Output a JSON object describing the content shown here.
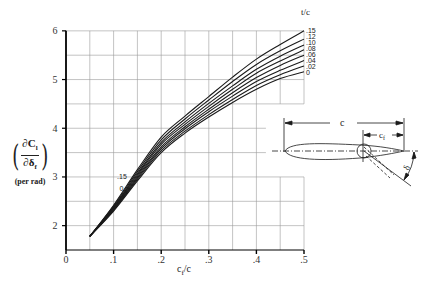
{
  "chart_data": {
    "type": "line",
    "title": "",
    "xlabel": "c_f/c",
    "ylabel": "(∂C_l / ∂δ_f) (per rad)",
    "xlim": [
      0,
      0.5
    ],
    "ylim": [
      1.5,
      6
    ],
    "xticks": [
      0,
      0.1,
      0.2,
      0.3,
      0.4,
      0.5
    ],
    "xtick_labels": [
      "0",
      ".1",
      ".2",
      ".3",
      ".4",
      ".5"
    ],
    "yticks": [
      2,
      3,
      4,
      5,
      6
    ],
    "ytick_labels": [
      "2",
      "3",
      "4",
      "5",
      "6"
    ],
    "grid": true,
    "legend_title": "t/c",
    "legend_position": "right end of curves",
    "x": [
      0.05,
      0.1,
      0.15,
      0.2,
      0.25,
      0.3,
      0.35,
      0.4,
      0.45,
      0.5
    ],
    "series": [
      {
        "name": ".15",
        "values": [
          1.78,
          2.42,
          3.15,
          3.82,
          4.25,
          4.65,
          5.05,
          5.42,
          5.72,
          6.0
        ]
      },
      {
        "name": ".12",
        "values": [
          1.78,
          2.4,
          3.11,
          3.76,
          4.19,
          4.58,
          4.96,
          5.31,
          5.59,
          5.83
        ]
      },
      {
        "name": ".10",
        "values": [
          1.78,
          2.38,
          3.07,
          3.71,
          4.13,
          4.51,
          4.87,
          5.21,
          5.48,
          5.71
        ]
      },
      {
        "name": ".08",
        "values": [
          1.78,
          2.37,
          3.04,
          3.67,
          4.08,
          4.45,
          4.8,
          5.13,
          5.38,
          5.61
        ]
      },
      {
        "name": ".06",
        "values": [
          1.78,
          2.35,
          3.01,
          3.62,
          4.03,
          4.39,
          4.73,
          5.04,
          5.29,
          5.5
        ]
      },
      {
        "name": ".04",
        "values": [
          1.78,
          2.33,
          2.98,
          3.58,
          3.99,
          4.34,
          4.66,
          4.96,
          5.19,
          5.39
        ]
      },
      {
        "name": ".02",
        "values": [
          1.78,
          2.32,
          2.95,
          3.54,
          3.94,
          4.28,
          4.59,
          4.88,
          5.1,
          5.28
        ]
      },
      {
        "name": "0",
        "values": [
          1.78,
          2.3,
          2.92,
          3.5,
          3.9,
          4.23,
          4.53,
          4.8,
          5.02,
          5.16
        ]
      }
    ],
    "annotations": [
      {
        "text": ".15",
        "x": 0.12,
        "y": 2.95
      },
      {
        "text": "0",
        "x": 0.125,
        "y": 2.72
      }
    ]
  },
  "labels": {
    "y_numerator": "∂C",
    "y_numerator_sub": "l",
    "y_denominator": "∂δ",
    "y_denominator_sub": "f",
    "y_units": "(per rad)",
    "x_main": "c",
    "x_sub": "f",
    "x_tail": "/c",
    "legend_title": "t/c",
    "curve_label_top": ".15",
    "curve_label_bottom": "0"
  },
  "inset": {
    "chord_label": "c",
    "flap_chord_label": "c",
    "flap_chord_sub": "f",
    "deflection_label": "δ"
  },
  "colors": {
    "line": "#1a1a1a",
    "grid": "#9a9a9a",
    "axis": "#000000",
    "background": "#ffffff"
  }
}
